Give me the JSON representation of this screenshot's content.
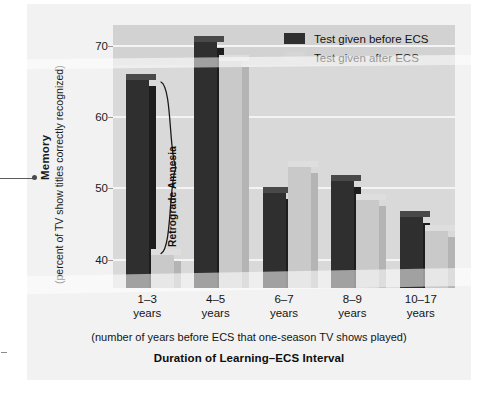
{
  "figure": {
    "y_axis_title": "Memory",
    "y_axis_subtitle": "(percent of TV show titles correctly recognized)",
    "x_axis_subtitle": "(number of years before ECS that one-season TV shows played)",
    "x_axis_title": "Duration of Learning–ECS Interval",
    "annotation_label": "Retrograde Amnesia",
    "colors": {
      "before_ecs": "#302f30",
      "after_ecs": "#c9c9c9",
      "plot_background": "#d9d9d9",
      "plot_background_top_band": "#d2d2d2",
      "gridline": "#f4f4f4",
      "panel_background": "#f2f2f2"
    }
  },
  "legend": {
    "position": "top-right-inside",
    "items": [
      {
        "label": "Test given before ECS",
        "swatch": "dark"
      },
      {
        "label": "Test given after ECS",
        "swatch": "light"
      }
    ]
  },
  "chart_data": {
    "type": "bar",
    "title": "Duration of Learning–ECS Interval",
    "subtitle": "(number of years before ECS that one-season TV shows played)",
    "xlabel": "Duration of Learning–ECS Interval",
    "ylabel": "Memory (percent of TV show titles correctly recognized)",
    "ylim": [
      36,
      73
    ],
    "yticks": [
      40,
      50,
      60,
      70
    ],
    "ytick_labels": [
      "40",
      "50",
      "60",
      "70"
    ],
    "grid": true,
    "categories": [
      "1–3\nyears",
      "4–5\nyears",
      "6–7\nyears",
      "8–9\nyears",
      "10–17\nyears"
    ],
    "category_lines": [
      [
        "1–3",
        "years"
      ],
      [
        "4–5",
        "years"
      ],
      [
        "6–7",
        "years"
      ],
      [
        "8–9",
        "years"
      ],
      [
        "10–17",
        "years"
      ]
    ],
    "series": [
      {
        "name": "Test given before ECS",
        "color": "#302f30",
        "values": [
          65.3,
          70.6,
          49.4,
          51.0,
          46.0
        ]
      },
      {
        "name": "Test given after ECS",
        "color": "#c9c9c9",
        "values": [
          40.6,
          68.0,
          53.0,
          48.4,
          44.0
        ]
      }
    ],
    "annotations": [
      {
        "text": "Retrograde Amnesia",
        "type": "brace",
        "category": "1–3 years",
        "spans_values": [
          40.6,
          65.3
        ]
      }
    ]
  }
}
